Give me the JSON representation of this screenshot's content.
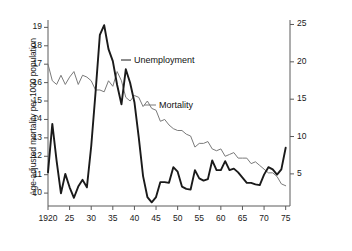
{
  "figure": {
    "background_color": "#ffffff",
    "mortality_color": "#7a7a7a",
    "unemployment_color": "#1a1a1a",
    "axis_color": "#5a5a5a"
  },
  "chart_data": {
    "type": "line",
    "title": "",
    "xlabel": "",
    "ylabel": "Age-adjusted mortality per 1000 population",
    "ylabel_right": "Unemployment rate per cent",
    "grid": false,
    "legend": "inline-annotations",
    "xlim": [
      1920,
      1976
    ],
    "xticks": [
      1920,
      1925,
      1930,
      1935,
      1940,
      1945,
      1950,
      1955,
      1960,
      1965,
      1970,
      1975
    ],
    "xticklabels": [
      "1920",
      "25",
      "30",
      "35",
      "40",
      "45",
      "50",
      "55",
      "60",
      "65",
      "70",
      "75"
    ],
    "ylim": [
      9.3,
      19.4
    ],
    "yticks": [
      10,
      11,
      12,
      13,
      14,
      15,
      16,
      17,
      18,
      19
    ],
    "yticklabels": [
      "10",
      "11",
      "12",
      "13",
      "14",
      "15",
      "16",
      "17",
      "18",
      "19"
    ],
    "ylim_right": [
      0.7,
      25.6
    ],
    "yticks_right": [
      5,
      10,
      15,
      20,
      25
    ],
    "yticklabels_right": [
      "5",
      "10",
      "15",
      "20",
      "25"
    ],
    "x": [
      1920,
      1921,
      1922,
      1923,
      1924,
      1925,
      1926,
      1927,
      1928,
      1929,
      1930,
      1931,
      1932,
      1933,
      1934,
      1935,
      1936,
      1937,
      1938,
      1939,
      1940,
      1941,
      1942,
      1943,
      1944,
      1945,
      1946,
      1947,
      1948,
      1949,
      1950,
      1951,
      1952,
      1953,
      1954,
      1955,
      1956,
      1957,
      1958,
      1959,
      1960,
      1961,
      1962,
      1963,
      1964,
      1965,
      1966,
      1967,
      1968,
      1969,
      1970,
      1971,
      1972,
      1973,
      1974,
      1975
    ],
    "series": [
      {
        "name": "Mortality",
        "axis": "left",
        "units": "deaths per 1000 population (age-adjusted)",
        "color": "#7a7a7a",
        "linewidth": 1,
        "label_position": {
          "x": 1957,
          "y": 15.0
        },
        "values": [
          17.0,
          16.1,
          15.9,
          16.4,
          15.9,
          16.3,
          16.6,
          15.9,
          16.4,
          16.3,
          16.1,
          15.6,
          15.6,
          15.5,
          16.1,
          15.8,
          16.6,
          16.1,
          15.2,
          15.0,
          15.3,
          15.2,
          14.7,
          15.0,
          14.6,
          14.5,
          13.9,
          14.0,
          13.7,
          13.5,
          13.4,
          13.4,
          13.2,
          13.1,
          12.5,
          12.7,
          12.7,
          12.8,
          12.4,
          12.3,
          12.4,
          12.0,
          12.1,
          12.2,
          11.9,
          11.9,
          11.9,
          11.6,
          11.7,
          11.5,
          11.3,
          11.1,
          11.1,
          10.9,
          10.5,
          10.4
        ]
      },
      {
        "name": "Unemployment",
        "axis": "right",
        "units": "per cent",
        "color": "#1a1a1a",
        "linewidth": 1.9,
        "label_position": {
          "x": 1940,
          "y": 21.5
        },
        "values": [
          5.2,
          11.7,
          6.7,
          2.4,
          5.0,
          3.2,
          1.8,
          3.3,
          4.2,
          3.2,
          8.7,
          15.9,
          23.6,
          24.9,
          21.7,
          20.1,
          16.9,
          14.3,
          19.0,
          17.2,
          14.6,
          9.9,
          4.7,
          1.9,
          1.2,
          1.9,
          3.9,
          3.9,
          3.8,
          5.9,
          5.3,
          3.3,
          3.0,
          2.9,
          5.5,
          4.4,
          4.1,
          4.3,
          6.8,
          5.5,
          5.5,
          6.7,
          5.5,
          5.7,
          5.2,
          4.5,
          3.8,
          3.8,
          3.6,
          3.5,
          4.9,
          5.9,
          5.6,
          4.9,
          5.6,
          8.5
        ]
      }
    ]
  },
  "axes": {
    "left_title": "Age-adjusted mortality per 1000 population",
    "right_title": "Unemployment rate per cent"
  },
  "annotations": {
    "unemployment": "Unemployment",
    "mortality": "Mortality"
  }
}
